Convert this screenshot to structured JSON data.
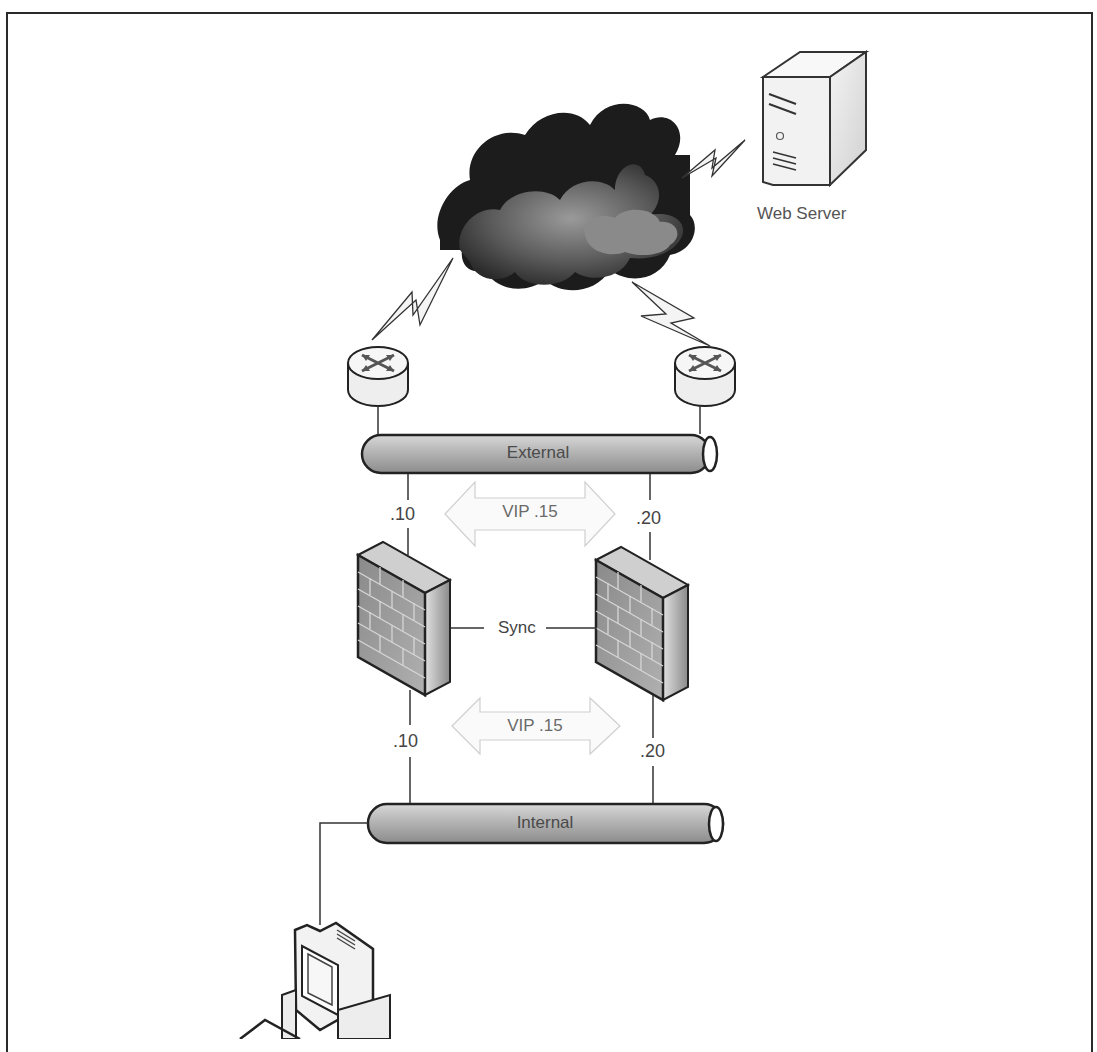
{
  "diagram": {
    "type": "network-topology",
    "nodes": {
      "internet": {
        "label": "",
        "icon": "cloud-icon"
      },
      "web_server": {
        "label": "Web Server",
        "icon": "server-icon"
      },
      "router_left": {
        "label": "",
        "icon": "router-icon"
      },
      "router_right": {
        "label": "",
        "icon": "router-icon"
      },
      "firewall_left": {
        "label": "",
        "icon": "firewall-icon"
      },
      "firewall_right": {
        "label": "",
        "icon": "firewall-icon"
      },
      "workstation": {
        "label": "",
        "icon": "computer-icon"
      }
    },
    "segments": {
      "external": {
        "label": "External"
      },
      "internal": {
        "label": "Internal"
      }
    },
    "addresses": {
      "ext_left": ".10",
      "ext_right": ".20",
      "int_left": ".10",
      "int_right": ".20",
      "ext_vip": "VIP .15",
      "int_vip": "VIP .15"
    },
    "links": {
      "sync": "Sync"
    },
    "edges": [
      {
        "from": "internet",
        "to": "web_server",
        "type": "wan"
      },
      {
        "from": "internet",
        "to": "router_left",
        "type": "wan"
      },
      {
        "from": "internet",
        "to": "router_right",
        "type": "wan"
      },
      {
        "from": "router_left",
        "to": "external",
        "type": "lan"
      },
      {
        "from": "router_right",
        "to": "external",
        "type": "lan"
      },
      {
        "from": "external",
        "to": "firewall_left",
        "label": ".10"
      },
      {
        "from": "external",
        "to": "firewall_right",
        "label": ".20"
      },
      {
        "from": "firewall_left",
        "to": "firewall_right",
        "label": "Sync"
      },
      {
        "from": "firewall_left",
        "to": "internal",
        "label": ".10"
      },
      {
        "from": "firewall_right",
        "to": "internal",
        "label": ".20"
      },
      {
        "from": "internal",
        "to": "workstation",
        "type": "lan"
      }
    ]
  }
}
